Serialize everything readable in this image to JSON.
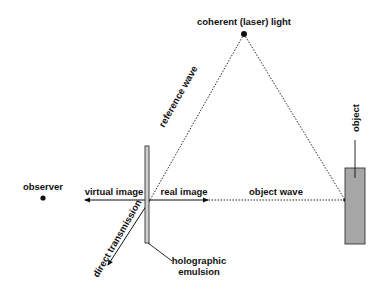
{
  "diagram": {
    "labels": {
      "laser": "coherent (laser) light",
      "reference_wave": "reference wave",
      "object": "object",
      "observer": "observer",
      "virtual_image": "virtual image",
      "real_image": "real image",
      "object_wave": "object wave",
      "direct_transmission": "direct transmission",
      "emulsion_line1": "holographic",
      "emulsion_line2": "emulsion"
    },
    "colors": {
      "line": "#111111",
      "object_fill": "#a6a6a6",
      "plate_fill": "#d0d0d0",
      "background": "#ffffff"
    }
  }
}
